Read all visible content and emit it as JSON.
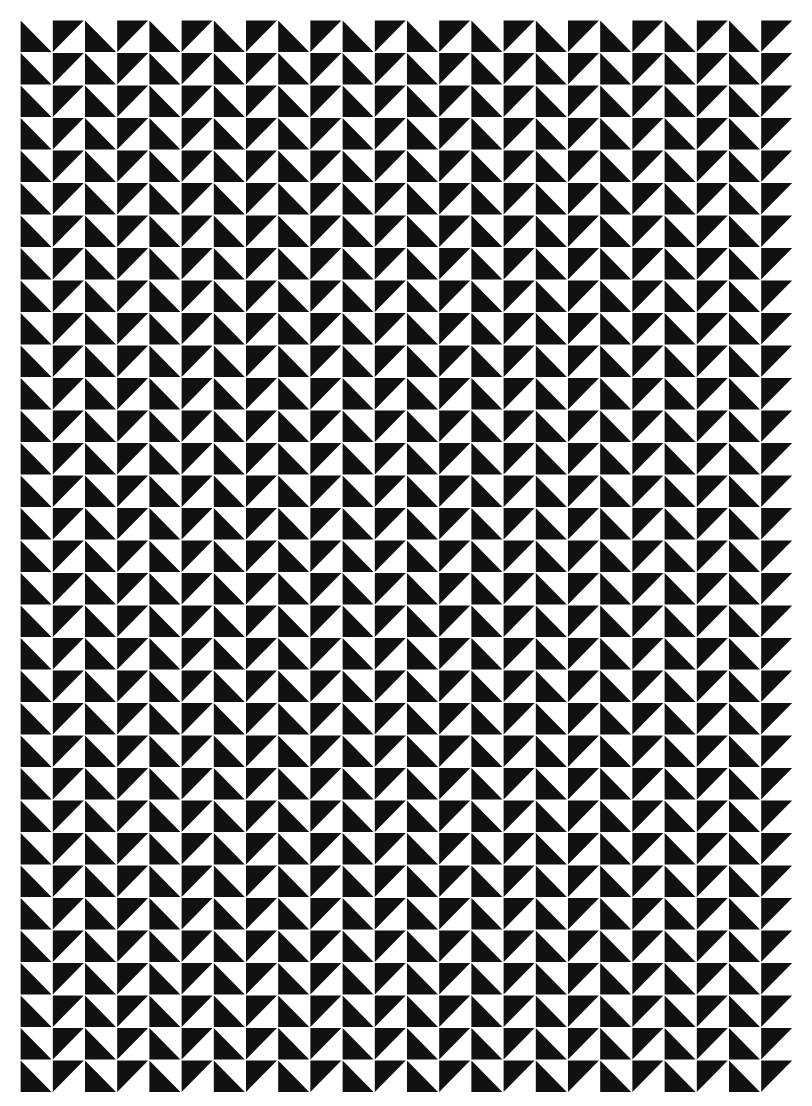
{
  "artwork": {
    "type": "geometric-pattern",
    "description": "Grid of black right-triangle half-square tiles on white",
    "grid": {
      "columns": 24,
      "rows": 33,
      "origin_x": 20,
      "origin_y": 20,
      "tile_width": 32.2,
      "tile_height": 32.5
    },
    "tile_types": {
      "A": {
        "shape": "black-lower-left-triangle",
        "columns": "even"
      },
      "B": {
        "shape": "black-upper-left-triangle",
        "columns": "odd"
      }
    },
    "colors": {
      "ink": "#111111",
      "paper": "#ffffff"
    }
  }
}
